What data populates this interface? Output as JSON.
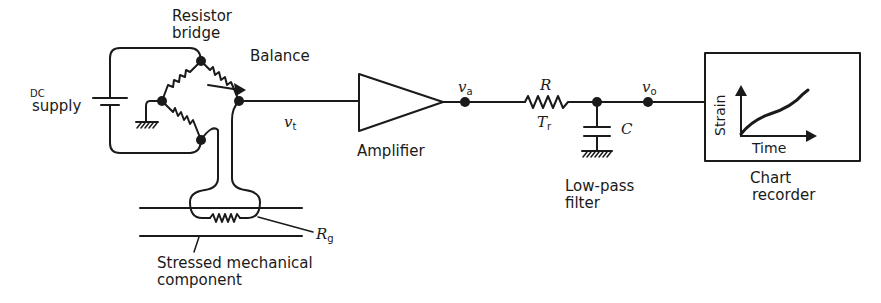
{
  "diagram": {
    "type": "strain-gauge measurement circuit",
    "blocks": {
      "dc_supply": {
        "label_line1": "DC",
        "label_line2": "supply"
      },
      "resistor_bridge": {
        "label_line1": "Resistor",
        "label_line2": "bridge"
      },
      "balance": {
        "label": "Balance"
      },
      "bridge_output": {
        "symbol": "v",
        "subscript": "t"
      },
      "amplifier": {
        "label": "Amplifier"
      },
      "amplifier_output": {
        "symbol": "v",
        "subscript": "a"
      },
      "low_pass_filter": {
        "resistor_label": "R",
        "time_constant_symbol": "T",
        "time_constant_subscript": "r",
        "capacitor_label": "C",
        "label_line1": "Low-pass",
        "label_line2": "filter"
      },
      "filter_output": {
        "symbol": "v",
        "subscript": "o"
      },
      "chart_recorder": {
        "label_line1": "Chart",
        "label_line2": "recorder",
        "y_axis_label": "Strain",
        "x_axis_label": "Time"
      },
      "strain_gauge": {
        "symbol": "R",
        "subscript": "g"
      },
      "mechanical_component": {
        "label_line1": "Stressed mechanical",
        "label_line2": "component"
      }
    },
    "signal_flow": [
      "DC supply",
      "Resistor bridge",
      "Amplifier",
      "Low-pass filter",
      "Chart recorder"
    ],
    "colors": {
      "ink": "#1a1a1a",
      "background": "#ffffff"
    }
  }
}
